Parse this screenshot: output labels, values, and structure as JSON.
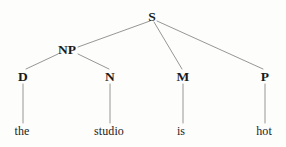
{
  "figure": {
    "type": "syntax-tree",
    "sentence": "the studio is hot",
    "background_color": "#fdfdfc",
    "edge_color": "#8a8a8a",
    "text_color": "#1b1b1b",
    "width": 286,
    "height": 147
  },
  "nodes": [
    {
      "id": "S",
      "label": "S",
      "kind": "category",
      "x": 152,
      "y": 17
    },
    {
      "id": "NP",
      "label": "NP",
      "kind": "category",
      "x": 67,
      "y": 50
    },
    {
      "id": "D",
      "label": "D",
      "kind": "category",
      "x": 23,
      "y": 77
    },
    {
      "id": "N",
      "label": "N",
      "kind": "category",
      "x": 110,
      "y": 77
    },
    {
      "id": "M",
      "label": "M",
      "kind": "category",
      "x": 183,
      "y": 77
    },
    {
      "id": "P",
      "label": "P",
      "kind": "category",
      "x": 265,
      "y": 77
    },
    {
      "id": "the",
      "label": "the",
      "kind": "leaf",
      "x": 22,
      "y": 131
    },
    {
      "id": "studio",
      "label": "studio",
      "kind": "leaf",
      "x": 109,
      "y": 131
    },
    {
      "id": "is",
      "label": "is",
      "kind": "leaf",
      "x": 181,
      "y": 131
    },
    {
      "id": "hot",
      "label": "hot",
      "kind": "leaf",
      "x": 264,
      "y": 131
    }
  ],
  "edges": [
    {
      "from": "S",
      "to": "NP",
      "x1": 150,
      "y1": 21,
      "x2": 78,
      "y2": 47
    },
    {
      "from": "S",
      "to": "M",
      "x1": 154,
      "y1": 22,
      "x2": 182,
      "y2": 69
    },
    {
      "from": "S",
      "to": "P",
      "x1": 157,
      "y1": 21,
      "x2": 263,
      "y2": 69
    },
    {
      "from": "NP",
      "to": "D",
      "x1": 58,
      "y1": 54,
      "x2": 26,
      "y2": 69
    },
    {
      "from": "NP",
      "to": "N",
      "x1": 78,
      "y1": 54,
      "x2": 109,
      "y2": 69
    },
    {
      "from": "D",
      "to": "the",
      "x1": 23,
      "y1": 84,
      "x2": 23,
      "y2": 123
    },
    {
      "from": "N",
      "to": "studio",
      "x1": 110,
      "y1": 84,
      "x2": 110,
      "y2": 123
    },
    {
      "from": "M",
      "to": "is",
      "x1": 183,
      "y1": 84,
      "x2": 183,
      "y2": 123
    },
    {
      "from": "P",
      "to": "hot",
      "x1": 265,
      "y1": 84,
      "x2": 265,
      "y2": 123
    }
  ]
}
